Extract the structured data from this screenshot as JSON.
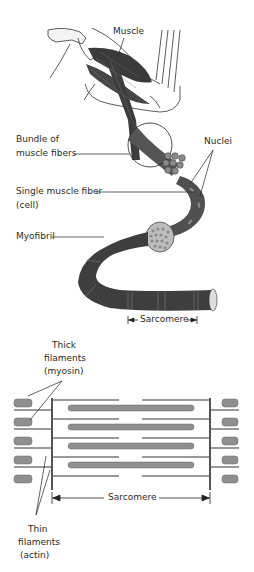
{
  "diagram": {
    "upper": {
      "labels": {
        "muscle": "Muscle",
        "bundle_line1": "Bundle of",
        "bundle_line2": "muscle fibers",
        "nuclei": "Nuclei",
        "single_line1": "Single muscle fiber",
        "single_line2": "(cell)",
        "myofibril": "Myofibril",
        "sarcomere": "Sarcomere"
      }
    },
    "lower": {
      "labels": {
        "thick_line1": "Thick",
        "thick_line2": "filaments",
        "thick_line3": "(myosin)",
        "thin_line1": "Thin",
        "thin_line2": "filaments",
        "thin_line3": "(actin)",
        "sarcomere": "Sarcomere"
      }
    },
    "colors": {
      "muscle_dark": "#3a3a3a",
      "fiber_mid": "#6b6b6b",
      "filament_gray": "#9a9a9a",
      "line": "#222222"
    }
  }
}
